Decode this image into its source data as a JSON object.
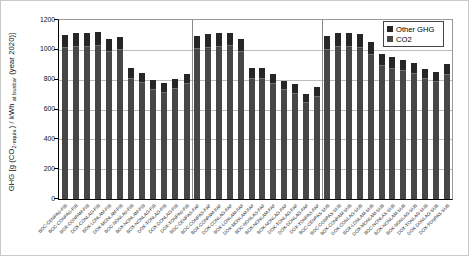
{
  "figure": {
    "ylabel_parts": {
      "p1": "GHG [g (CO",
      "sub1": "2-equiv.",
      "p2": ") / kWh ",
      "sub2": "at busbar",
      "p3": " (year 2020)]"
    }
  },
  "chart_data": {
    "type": "bar",
    "stacked": true,
    "title": "",
    "xlabel": "",
    "ylabel": "GHG [g (CO2-equiv.) / kWh at busbar (year 2020)]",
    "ylim": [
      0,
      1200
    ],
    "ytick_interval": 200,
    "yticks": [
      0,
      200,
      400,
      600,
      800,
      1000,
      1200
    ],
    "grid": "horizontal",
    "legend_position": "top-right-inside",
    "group_suffixes": [
      "FIB",
      "FAF",
      "SUB"
    ],
    "bars_per_group": 12,
    "categories": [
      "BOC-CENPAS-FIB",
      "BOC-CONPAS-FIB",
      "BOX-CONPAM-FIB",
      "DOX-CONLAG-FIB",
      "BOX-LONLAM-FIB",
      "DOX-MONLAM-FIB",
      "BOC-NONLAS-FIB",
      "BOX-NONLAM-FIB",
      "BOX-NONLAG-FIB",
      "DOX-TONLAG-FIB",
      "DOX-DONLAG-FIB",
      "DOX-TONPAS-FIB",
      "BOC-CENPAS-FAF",
      "BOC-CONPAS-FAF",
      "BOX-CONPAM-FAF",
      "DOX-CONLAG-FAF",
      "BOX-LONLAM-FAF",
      "DOX-MONLAM-FAF",
      "BOC-NONLAS-FAF",
      "BOX-NONLAM-FAF",
      "BOX-NONLAG-FAF",
      "DOX-TONLAG-FAF",
      "DOX-DONLAG-FAF",
      "DOX-TONPAS-FAF",
      "BOC-CENPAS-SUB",
      "BOC-CONPAS-SUB",
      "BOX-CONPAM-SUB",
      "DOX-CONLAG-SUB",
      "BOX-LONLAM-SUB",
      "DOX-MONLAM-SUB",
      "BOC-NONLAS-SUB",
      "BOX-NONLAM-SUB",
      "BOX-NONLAG-SUB",
      "DOX-TONLAG-SUB",
      "DOX-DONLAG-SUB",
      "DOX-TONPAS-SUB"
    ],
    "series": [
      {
        "name": "CO2",
        "values": [
          1018,
          1027,
          1027,
          1036,
          990,
          1004,
          814,
          782,
          740,
          717,
          745,
          777,
          1013,
          1022,
          1027,
          1031,
          990,
          814,
          814,
          777,
          735,
          712,
          652,
          694,
          1008,
          1027,
          1027,
          1022,
          971,
          897,
          879,
          865,
          842,
          809,
          791,
          837
        ]
      },
      {
        "name": "Other GHG",
        "values": [
          82,
          83,
          83,
          84,
          80,
          81,
          66,
          63,
          60,
          58,
          60,
          63,
          82,
          83,
          83,
          84,
          80,
          66,
          66,
          63,
          60,
          58,
          53,
          56,
          82,
          83,
          83,
          83,
          79,
          73,
          71,
          70,
          68,
          66,
          64,
          68
        ]
      }
    ],
    "totals": [
      1100,
      1110,
      1110,
      1120,
      1070,
      1085,
      880,
      845,
      800,
      775,
      805,
      840,
      1095,
      1105,
      1110,
      1115,
      1070,
      880,
      880,
      840,
      795,
      770,
      705,
      750,
      1090,
      1110,
      1110,
      1105,
      1050,
      970,
      950,
      935,
      910,
      875,
      855,
      905
    ],
    "legend": [
      {
        "label": "Other GHG",
        "color": "#262626"
      },
      {
        "label": "CO2",
        "color": "#474747"
      }
    ],
    "colors": {
      "co2": "#474747",
      "other_ghg": "#262626",
      "segment_boundary": "#6e6e6e",
      "gridline": "#bdbdbd",
      "group_separator": "#8a8a8a"
    }
  }
}
